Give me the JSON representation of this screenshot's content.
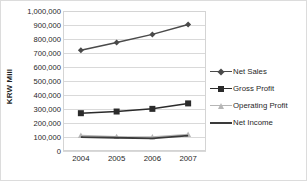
{
  "chart_data": {
    "type": "line",
    "title": "",
    "xlabel": "",
    "ylabel": "KRW Mill",
    "categories": [
      "2004",
      "2005",
      "2006",
      "2007"
    ],
    "x_tick_labels": [
      "2004",
      "2005",
      "2006",
      "2007"
    ],
    "y_tick_labels": [
      "1,000,000",
      "900,000",
      "800,000",
      "700,000",
      "600,000",
      "500,000",
      "400,000",
      "300,000",
      "200,000",
      "100,000",
      "0"
    ],
    "y_tick_values": [
      1000000,
      900000,
      800000,
      700000,
      600000,
      500000,
      400000,
      300000,
      200000,
      100000,
      0
    ],
    "ylim": [
      0,
      1000000
    ],
    "y_tick_step": 100000,
    "grid": true,
    "legend_position": "right",
    "series": [
      {
        "name": "Net Sales",
        "marker": "diamond",
        "color": "#4a4a4a",
        "values": [
          720000,
          775000,
          833000,
          903000
        ]
      },
      {
        "name": "Gross Profit",
        "marker": "square",
        "color": "#2b2b2b",
        "values": [
          270000,
          282000,
          301000,
          340000
        ]
      },
      {
        "name": "Operating Profit",
        "marker": "triangle",
        "color": "#b6b6b6",
        "values": [
          110000,
          102000,
          100000,
          118000
        ]
      },
      {
        "name": "Net Income",
        "marker": "none",
        "color": "#3a3a3a",
        "values": [
          99000,
          95000,
          90000,
          110000
        ]
      }
    ]
  },
  "legend": {
    "entries": [
      {
        "label": "Net Sales"
      },
      {
        "label": "Gross Profit"
      },
      {
        "label": "Operating Profit"
      },
      {
        "label": "Net Income"
      }
    ]
  },
  "colors": {
    "frame_border": "#dcdcdc",
    "plot_border": "#d4d4d4",
    "gridline": "#d9d9d9",
    "text": "#1f1f1f",
    "net_sales": "#4a4a4a",
    "gross_profit": "#2b2b2b",
    "operating_profit": "#b6b6b6",
    "net_income": "#3a3a3a"
  }
}
